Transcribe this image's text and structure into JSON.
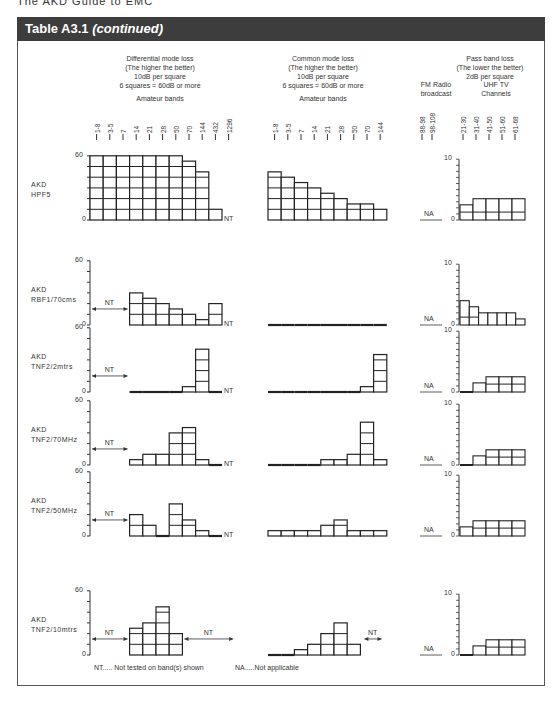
{
  "page": {
    "top_text": "The AKD Guide to EMC",
    "header": {
      "title": "Table A3.1",
      "title_suffix": "(continued)"
    }
  },
  "columns": {
    "differential": {
      "title": "Differential mode loss",
      "sub1": "(The higher the better)",
      "sub2": "10dB per square",
      "sub3": "6 squares = 60dB or more",
      "band_title": "Amateur bands"
    },
    "common": {
      "title": "Common mode loss",
      "sub1": "(The higher the better)",
      "sub2": "10dB per square",
      "sub3": "6 squares = 60dB or more",
      "band_title": "Amateur bands"
    },
    "passband": {
      "title": "Pass band loss",
      "sub1": "(The lower the better)",
      "sub2": "2dB per square",
      "fm_title1": "FM Radio",
      "fm_title2": "broadcast",
      "uhf_title1": "UHF TV",
      "uhf_title2": "Channels"
    }
  },
  "legend": {
    "nt": "NT..... Not tested on band(s) shown",
    "na": "NA.....Not applicable"
  },
  "labels": {
    "nt": "NT",
    "na": "NA"
  },
  "chart_data": {
    "type": "bar",
    "title": "Table A3.1 (continued)",
    "panels": [
      "Differential mode loss (dB)",
      "Common mode loss (dB)",
      "Pass band loss (dB)"
    ],
    "diff_categories": [
      "1-8",
      "3-5",
      "7",
      "14",
      "21",
      "28",
      "50",
      "70",
      "144",
      "432",
      "1296"
    ],
    "common_categories": [
      "1-8",
      "3-5",
      "7",
      "14",
      "21",
      "28",
      "50",
      "70",
      "144"
    ],
    "pass_categories": [
      "88-98",
      "98-108",
      "21-30",
      "31-40",
      "41-50",
      "51-60",
      "61-68"
    ],
    "diff_ylim": [
      0,
      60
    ],
    "pass_ylim": [
      0,
      10
    ],
    "rows": [
      {
        "name": "AKD HPF5",
        "label1": "AKD",
        "label2": "HPF5",
        "diff_top": "60",
        "diff": [
          60,
          60,
          60,
          60,
          60,
          60,
          60,
          55,
          45,
          10,
          "NT"
        ],
        "common": [
          45,
          40,
          35,
          30,
          25,
          20,
          15,
          15,
          10
        ],
        "pass": [
          "NA",
          "NA",
          2.5,
          3.5,
          3.5,
          3.5,
          3.5
        ]
      },
      {
        "name": "AKD RBF1/70cms",
        "label1": "AKD",
        "label2": "RBF1/70cms",
        "diff_top": "60",
        "diff": [
          "NT",
          "NT",
          "NT",
          30,
          25,
          20,
          15,
          10,
          5,
          20,
          "NT"
        ],
        "common": [
          0,
          0,
          0,
          0,
          0,
          0,
          0,
          0,
          0
        ],
        "pass": [
          "NA",
          "NA",
          4,
          3,
          2,
          2,
          2,
          2,
          1
        ]
      },
      {
        "name": "AKD TNF2/2mtrs",
        "label1": "AKD",
        "label2": "TNF2/2mtrs",
        "diff_top": "60",
        "diff": [
          "NT",
          "NT",
          "NT",
          0,
          0,
          0,
          0,
          5,
          40,
          0,
          "NT"
        ],
        "common": [
          0,
          0,
          0,
          0,
          0,
          0,
          0,
          5,
          35
        ],
        "pass": [
          "NA",
          "NA",
          0.5,
          1.5,
          2.5,
          2.5,
          2.5
        ]
      },
      {
        "name": "AKD TNF2/70MHz",
        "label1": "AKD",
        "label2": "TNF2/70MHz",
        "diff_top": "60",
        "diff": [
          "NT",
          "NT",
          "NT",
          5,
          10,
          10,
          30,
          35,
          5,
          0,
          "NT"
        ],
        "common": [
          0,
          0,
          0,
          0,
          5,
          5,
          10,
          40,
          5
        ],
        "pass": [
          "NA",
          "NA",
          0.5,
          1.5,
          2.5,
          2.5,
          2.5
        ]
      },
      {
        "name": "AKD TNF2/50MHz",
        "label1": "AKD",
        "label2": "TNF2/50MHz",
        "diff_top": "60",
        "diff": [
          "NT",
          "NT",
          "NT",
          20,
          10,
          0,
          30,
          15,
          5,
          0,
          "NT"
        ],
        "common": [
          5,
          5,
          5,
          5,
          10,
          15,
          5,
          5,
          5
        ],
        "pass": [
          "NA",
          "NA",
          1.5,
          2.5,
          2.5,
          2.5,
          2.5
        ]
      },
      {
        "name": "AKD TNF2/10mtrs",
        "label1": "AKD",
        "label2": "TNF2/10mtrs",
        "diff_top": "60",
        "diff": [
          "NT",
          "NT",
          "NT",
          25,
          30,
          45,
          20,
          "NT",
          "NT",
          "NT",
          "NT"
        ],
        "common": [
          0,
          0,
          5,
          10,
          20,
          30,
          10,
          "NT",
          "NT"
        ],
        "pass": [
          "NA",
          "NA",
          0.5,
          1.5,
          2.5,
          2.5,
          2.5
        ]
      }
    ]
  }
}
